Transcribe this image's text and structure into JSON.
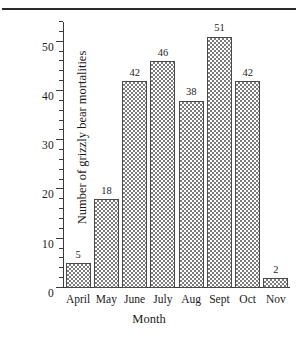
{
  "chart_data": {
    "type": "bar",
    "title": "",
    "xlabel": "Month",
    "ylabel": "Number of grizzly bear mortalities",
    "categories": [
      "April",
      "May",
      "June",
      "July",
      "Aug",
      "Sept",
      "Oct",
      "Nov"
    ],
    "values": [
      5,
      18,
      42,
      46,
      38,
      51,
      42,
      2
    ],
    "value_labels": [
      "5",
      "18",
      "42",
      "46",
      "38",
      "51",
      "42",
      "2"
    ],
    "ylim": [
      0,
      54
    ],
    "ytick_labels": [
      "0",
      "10",
      "20",
      "30",
      "40",
      "50"
    ],
    "ytick_values": [
      0,
      10,
      20,
      30,
      40,
      50
    ],
    "yminor_step": 2,
    "grid": false,
    "legend": false,
    "bar_fill": "checkerboard-hatch",
    "colors": {
      "axis": "#3a3a3a",
      "bar_edge": "#4a4a4a",
      "bar_pattern": "#7d7d7d",
      "background": "#ffffff",
      "text": "#1a1a1a",
      "rule": "#2b2b2b"
    }
  }
}
